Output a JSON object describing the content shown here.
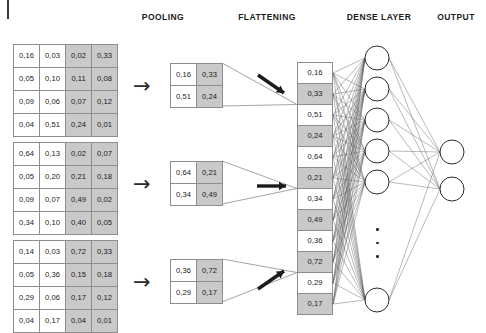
{
  "headers": [
    {
      "label": "POOLING",
      "x": 123,
      "y": 12,
      "w": 80
    },
    {
      "label": "FLATTENING",
      "x": 222,
      "y": 12,
      "w": 90
    },
    {
      "label": "DENSE LAYER",
      "x": 336,
      "y": 12,
      "w": 86
    },
    {
      "label": "OUTPUT",
      "x": 429,
      "y": 12,
      "w": 54
    }
  ],
  "feature_maps": [
    {
      "name": "feature-map-1",
      "x": 13,
      "y": 44,
      "rows": [
        [
          "0,16",
          "0,03",
          "0,02",
          "0,33"
        ],
        [
          "0,05",
          "0,10",
          "0,11",
          "0,08"
        ],
        [
          "0,09",
          "0,06",
          "0,07",
          "0,12"
        ],
        [
          "0,04",
          "0,51",
          "0,24",
          "0,01"
        ]
      ],
      "shaded_columns": [
        2,
        3
      ]
    },
    {
      "name": "feature-map-2",
      "x": 13,
      "y": 142,
      "rows": [
        [
          "0,64",
          "0,13",
          "0,02",
          "0,07"
        ],
        [
          "0,05",
          "0,20",
          "0,21",
          "0,18"
        ],
        [
          "0,09",
          "0,07",
          "0,49",
          "0,02"
        ],
        [
          "0,34",
          "0,10",
          "0,40",
          "0,05"
        ]
      ],
      "shaded_columns": [
        2,
        3
      ]
    },
    {
      "name": "feature-map-3",
      "x": 13,
      "y": 240,
      "rows": [
        [
          "0,14",
          "0,03",
          "0,72",
          "0,33"
        ],
        [
          "0,05",
          "0,36",
          "0,15",
          "0,18"
        ],
        [
          "0,29",
          "0,06",
          "0,17",
          "0,12"
        ],
        [
          "0,04",
          "0,17",
          "0,04",
          "0,01"
        ]
      ],
      "shaded_columns": [
        2,
        3
      ]
    }
  ],
  "pool_arrows": [
    {
      "name": "pool-arrow-1",
      "glyph": "→",
      "x": 133,
      "y": 76
    },
    {
      "name": "pool-arrow-2",
      "glyph": "→",
      "x": 133,
      "y": 174
    },
    {
      "name": "pool-arrow-3",
      "glyph": "→",
      "x": 133,
      "y": 272
    }
  ],
  "pooled_maps": [
    {
      "name": "pooled-map-1",
      "x": 170,
      "y": 63,
      "rows": [
        [
          "0,16",
          "0,33"
        ],
        [
          "0,51",
          "0,24"
        ]
      ],
      "shaded_columns": [
        1
      ]
    },
    {
      "name": "pooled-map-2",
      "x": 170,
      "y": 161,
      "rows": [
        [
          "0,64",
          "0,21"
        ],
        [
          "0,34",
          "0,49"
        ]
      ],
      "shaded_columns": [
        1
      ]
    },
    {
      "name": "pooled-map-3",
      "x": 170,
      "y": 259,
      "rows": [
        [
          "0,36",
          "0,72"
        ],
        [
          "0,29",
          "0,17"
        ]
      ],
      "shaded_columns": [
        1
      ]
    }
  ],
  "flatten_arrows": [
    {
      "name": "flatten-arrow-down-right",
      "direction": "down-right",
      "x": 256,
      "y": 72
    },
    {
      "name": "flatten-arrow-right",
      "direction": "right",
      "x": 256,
      "y": 174
    },
    {
      "name": "flatten-arrow-up-right",
      "direction": "up-right",
      "x": 256,
      "y": 268
    }
  ],
  "flatten_column": {
    "name": "flatten-vector",
    "x": 297,
    "y": 62,
    "values": [
      "0,16",
      "0,33",
      "0,51",
      "0,24",
      "0,64",
      "0,21",
      "0,34",
      "0,49",
      "0,36",
      "0,72",
      "0,29",
      "0,17"
    ],
    "shaded_indices": [
      1,
      3,
      5,
      7,
      9,
      11
    ]
  },
  "dense_layer": {
    "name": "dense-layer",
    "cx": 377,
    "radius": 12,
    "node_y": [
      58,
      89,
      120,
      151,
      182,
      300
    ],
    "ellipsis": {
      "x": 376,
      "y": 228,
      "count": 3
    }
  },
  "output_layer": {
    "name": "output-layer",
    "cx": 452,
    "radius": 12,
    "node_y": [
      152,
      189
    ]
  },
  "colors": {
    "cell_background": "#ffffff",
    "cell_shaded": "#c9c9c9",
    "grid_border": "#8e8e8e",
    "ink": "#1c1c1c",
    "edge": "#6b6b6b"
  }
}
